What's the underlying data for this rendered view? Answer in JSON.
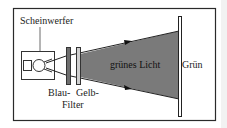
{
  "labels": {
    "lamp": "Scheinwerfer",
    "filter_blue": "Blau-",
    "filter_yellow": "Gelb-",
    "filter": "Filter",
    "beam": "grünes Licht",
    "screen": "Grün"
  },
  "colors": {
    "frame": "#2a2a2a",
    "beam": "#7a7a7a",
    "filter_blue": "#6e6e6e",
    "filter_yellow": "#b8b8b8",
    "background": "#ffffff"
  }
}
